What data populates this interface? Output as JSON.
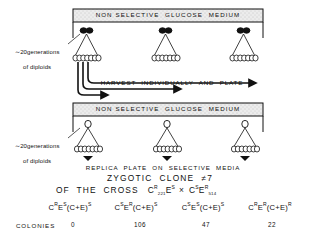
{
  "figure": {
    "panels": [
      {
        "medium_label": "NON SELECTIVE  GLUCOSE  MEDIUM",
        "side_label_line1": "∼20generations",
        "side_label_line2": "of diploids",
        "cell_type": "paired-filled-cells",
        "clusters": 3,
        "budding_cells_per_cluster": 7
      },
      {
        "medium_label": "NON SELECTIVE  GLUCOSE  MEDIUM",
        "side_label_line1": "∼20generations",
        "side_label_line2": "of diploids",
        "cell_type": "single-open-cell",
        "clusters": 3,
        "budding_cells_per_cluster": 7
      }
    ],
    "step_label_harvest": "HARVEST  INDIVIDUALLY  AND  PLATE",
    "step_label_replica": "REPLICA  PLATE  ON  SELECTIVE  MEDIA"
  },
  "caption": {
    "line1": "ZYGOTIC  CLONE  ≠7",
    "line2_prefix": "OF  THE  CROSS",
    "cross": {
      "parent1": {
        "gene1": "C",
        "gene1_sup": "R",
        "gene1_sub": "221",
        "gene2": "E",
        "gene2_sup": "S"
      },
      "operator": "×",
      "parent2": {
        "gene1": "C",
        "gene1_sup": "S",
        "gene2": "E",
        "gene2_sup": "R",
        "gene2_sub": "514"
      }
    }
  },
  "genotypes": [
    {
      "text": "C",
      "sup1": "R",
      "mid": "E",
      "sup2": "S",
      "tail": "(C+E)",
      "sup3": "S"
    },
    {
      "text": "C",
      "sup1": "S",
      "mid": "E",
      "sup2": "R",
      "tail": "(C+E)",
      "sup3": "S"
    },
    {
      "text": "C",
      "sup1": "S",
      "mid": "E",
      "sup2": "S",
      "tail": "(C+E)",
      "sup3": "S"
    },
    {
      "text": "C",
      "sup1": "R",
      "mid": "E",
      "sup2": "R",
      "tail": "(C+E)",
      "sup3": "R"
    }
  ],
  "colonies": {
    "row_label": "COLONIES",
    "values": [
      "0",
      "106",
      "47",
      "22"
    ]
  },
  "colors": {
    "ink": "#111111",
    "medium_fill": "#e6e6e6",
    "background": "#ffffff"
  }
}
